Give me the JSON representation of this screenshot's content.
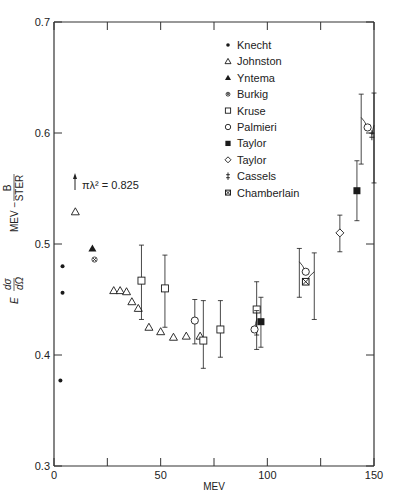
{
  "chart_data": {
    "type": "scatter",
    "title": "",
    "xlabel": "MEV",
    "ylabel_parts": {
      "lhs": "E dσ/dΩ",
      "units_num": "B",
      "units_prefix": "MEV −",
      "units_den": "STER"
    },
    "xlim": [
      0,
      150
    ],
    "ylim": [
      0.3,
      0.7
    ],
    "x_ticks": [
      0,
      25,
      50,
      75,
      100,
      125,
      150
    ],
    "x_tick_labels": [
      "0",
      "",
      "50",
      "",
      "100",
      "",
      "150"
    ],
    "y_ticks": [
      0.3,
      0.4,
      0.5,
      0.6,
      0.7
    ],
    "y_tick_labels": [
      "0.3",
      "0.4",
      "0.5",
      "0.6",
      "0.7"
    ],
    "grid": false,
    "legend_position": "upper-center",
    "annotation": {
      "text": "πλ² = 0.825",
      "x": 2,
      "y": 0.535,
      "arrow": "up"
    },
    "series": [
      {
        "name": "Knecht",
        "marker": "dot",
        "points": [
          {
            "x": 3,
            "y": 0.377
          },
          {
            "x": 4,
            "y": 0.456
          },
          {
            "x": 4,
            "y": 0.48
          }
        ]
      },
      {
        "name": "Johnston",
        "marker": "triangle-open",
        "points": [
          {
            "x": 10,
            "y": 0.529
          },
          {
            "x": 28,
            "y": 0.458
          },
          {
            "x": 31,
            "y": 0.458
          },
          {
            "x": 34,
            "y": 0.457
          },
          {
            "x": 36.5,
            "y": 0.448
          },
          {
            "x": 39.5,
            "y": 0.442
          },
          {
            "x": 44.5,
            "y": 0.425
          },
          {
            "x": 50,
            "y": 0.421
          },
          {
            "x": 56,
            "y": 0.416
          },
          {
            "x": 62,
            "y": 0.417
          },
          {
            "x": 68.5,
            "y": 0.417
          }
        ]
      },
      {
        "name": "Yntema",
        "marker": "triangle-filled",
        "points": [
          {
            "x": 18,
            "y": 0.496
          }
        ]
      },
      {
        "name": "Burkig",
        "marker": "circle-x-small",
        "points": [
          {
            "x": 19,
            "y": 0.486
          }
        ]
      },
      {
        "name": "Kruse",
        "marker": "square-open",
        "points": [
          {
            "x": 41,
            "y": 0.467,
            "ylo": 0.432,
            "yhi": 0.499
          },
          {
            "x": 52,
            "y": 0.46,
            "ylo": 0.425,
            "yhi": 0.49
          },
          {
            "x": 70,
            "y": 0.413,
            "ylo": 0.388,
            "yhi": 0.449
          },
          {
            "x": 78,
            "y": 0.423,
            "ylo": 0.398,
            "yhi": 0.449
          },
          {
            "x": 95,
            "y": 0.441,
            "ylo": 0.418,
            "yhi": 0.466
          }
        ]
      },
      {
        "name": "Palmieri",
        "marker": "circle-open",
        "points": [
          {
            "x": 66,
            "y": 0.431,
            "ylo": 0.41,
            "yhi": 0.45
          },
          {
            "x": 94,
            "y": 0.423,
            "ylo": 0.405,
            "yhi": 0.44,
            "offset_to": 95
          },
          {
            "x": 118,
            "y": 0.475,
            "ylo": 0.452,
            "yhi": 0.496,
            "offset_to": 115
          },
          {
            "x": 147,
            "y": 0.605,
            "ylo": 0.572,
            "yhi": 0.635,
            "offset_to": 144
          }
        ]
      },
      {
        "name": "Taylor",
        "marker": "square-filled",
        "points": [
          {
            "x": 97,
            "y": 0.43,
            "ylo": 0.407,
            "yhi": 0.452
          },
          {
            "x": 142,
            "y": 0.548,
            "ylo": 0.521,
            "yhi": 0.575
          }
        ]
      },
      {
        "name": "Taylor",
        "marker": "diamond-open",
        "points": [
          {
            "x": 134,
            "y": 0.51,
            "ylo": 0.493,
            "yhi": 0.526
          }
        ]
      },
      {
        "name": "Cassels",
        "marker": "double-bar",
        "points": [
          {
            "x": 149,
            "y": 0.598,
            "ylo": 0.555,
            "yhi": 0.636,
            "offset_to": 150
          }
        ]
      },
      {
        "name": "Chamberlain",
        "marker": "square-x",
        "points": [
          {
            "x": 118,
            "y": 0.466,
            "ylo": 0.432,
            "yhi": 0.492,
            "offset_to": 122
          }
        ]
      }
    ]
  },
  "legend": {
    "items": [
      {
        "label": "Knecht",
        "marker": "dot"
      },
      {
        "label": "Johnston",
        "marker": "triangle-open"
      },
      {
        "label": "Yntema",
        "marker": "triangle-filled"
      },
      {
        "label": "Burkig",
        "marker": "circle-x-small"
      },
      {
        "label": "Kruse",
        "marker": "square-open"
      },
      {
        "label": "Palmieri",
        "marker": "circle-open"
      },
      {
        "label": "Taylor",
        "marker": "square-filled"
      },
      {
        "label": "Taylor",
        "marker": "diamond-open"
      },
      {
        "label": "Cassels",
        "marker": "double-bar"
      },
      {
        "label": "Chamberlain",
        "marker": "square-x"
      }
    ]
  },
  "axes": {
    "x_title": "MEV",
    "y_title_lhs": "E",
    "y_title_frac_num": "dσ",
    "y_title_frac_den": "dΩ",
    "y_units_prefix": "MEV −",
    "y_units_num": "B",
    "y_units_den": "STER"
  },
  "annotation_text": "πλ² = 0.825",
  "colors": {
    "ink": "#1a1a1a",
    "axis": "#333333",
    "background": "#ffffff"
  }
}
